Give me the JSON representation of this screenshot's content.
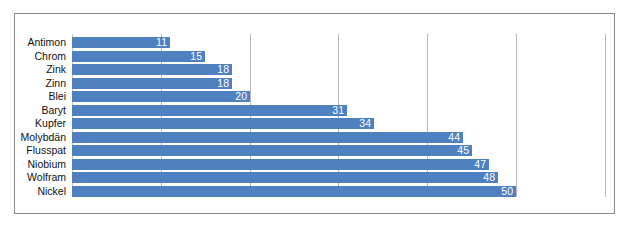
{
  "chart_data": {
    "type": "bar",
    "orientation": "horizontal",
    "title": "",
    "xlabel": "",
    "ylabel": "",
    "categories": [
      "Antimon",
      "Chrom",
      "Zink",
      "Zinn",
      "Blei",
      "Baryt",
      "Kupfer",
      "Molybdän",
      "Flusspat",
      "Niobium",
      "Wolfram",
      "Nickel"
    ],
    "values": [
      11,
      15,
      18,
      18,
      20,
      31,
      34,
      44,
      45,
      47,
      48,
      50
    ],
    "xlim": [
      0,
      60
    ],
    "gridlines": [
      10,
      20,
      30,
      40,
      50,
      60
    ],
    "grid": true,
    "data_labels": true,
    "legend": null,
    "bar_color": "#4f81c1"
  }
}
